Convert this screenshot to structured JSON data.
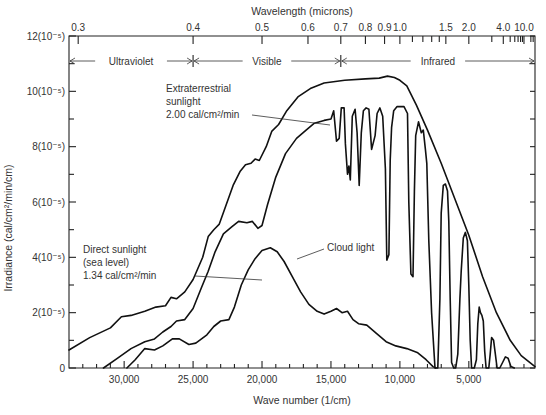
{
  "chart_data": {
    "type": "line",
    "title": "",
    "xlabel": "Wave number (1/cm)",
    "ylabel": "Irradiance (cal/cm²/min/cm)",
    "top_axis_label": "Wavelength (microns)",
    "xlim": [
      34000,
      200
    ],
    "x_reversed": true,
    "ylim": [
      0,
      12
    ],
    "y_unit_multiplier": "10^-5",
    "grid": false,
    "legend": "inline annotations",
    "x_ticks": [
      {
        "value": 30000,
        "label": "30,000"
      },
      {
        "value": 25000,
        "label": "25,000"
      },
      {
        "value": 20000,
        "label": "20,000"
      },
      {
        "value": 15000,
        "label": "15,000"
      },
      {
        "value": 10000,
        "label": "10,000"
      },
      {
        "value": 5000,
        "label": "5,000"
      }
    ],
    "y_ticks": [
      {
        "value": 0,
        "label": "0"
      },
      {
        "value": 2,
        "label": "2(10⁻⁵)"
      },
      {
        "value": 4,
        "label": "4(10⁻⁵)"
      },
      {
        "value": 6,
        "label": "6(10⁻⁵)"
      },
      {
        "value": 8,
        "label": "8(10⁻⁵)"
      },
      {
        "value": 10,
        "label": "10(10⁻⁵)"
      },
      {
        "value": 12,
        "label": "12(10⁻⁵)"
      }
    ],
    "top_ticks": [
      {
        "value": 0.3,
        "label": "0.3"
      },
      {
        "value": 0.4,
        "label": "0.4"
      },
      {
        "value": 0.5,
        "label": "0.5"
      },
      {
        "value": 0.6,
        "label": "0.6"
      },
      {
        "value": 0.7,
        "label": "0.7"
      },
      {
        "value": 0.8,
        "label": "0.8"
      },
      {
        "value": 0.9,
        "label": "0.9"
      },
      {
        "value": 1.0,
        "label": "1.0"
      },
      {
        "value": 1.5,
        "label": "1.5"
      },
      {
        "value": 2.0,
        "label": "2.0"
      },
      {
        "value": 4.0,
        "label": "4.0"
      },
      {
        "value": 10.0,
        "label": "10.0"
      }
    ],
    "top_minor_ticks": [
      1.1,
      1.2,
      1.3,
      1.4,
      3.0,
      5.0,
      6.0,
      7.0,
      8.0,
      9.0,
      20.0,
      30.0
    ],
    "regions": [
      {
        "label": "Ultraviolet",
        "from_um": 0.294,
        "to_um": 0.4
      },
      {
        "label": "Visible",
        "from_um": 0.4,
        "to_um": 0.7
      },
      {
        "label": "Infrared",
        "from_um": 0.7,
        "to_um": 50
      }
    ],
    "series": [
      {
        "name": "Extraterrestrial sunlight",
        "annotation": [
          "Extraterrestrial",
          "sunlight",
          "2.00 cal/cm²/min"
        ],
        "total": "2.00 cal/cm²/min",
        "points": [
          [
            34000,
            0.65
          ],
          [
            32500,
            1.1
          ],
          [
            31000,
            1.45
          ],
          [
            30200,
            1.85
          ],
          [
            29500,
            1.9
          ],
          [
            28500,
            2.05
          ],
          [
            27700,
            2.2
          ],
          [
            27000,
            2.25
          ],
          [
            26600,
            2.55
          ],
          [
            26200,
            2.5
          ],
          [
            25600,
            2.75
          ],
          [
            25000,
            3.2
          ],
          [
            24300,
            4.0
          ],
          [
            23900,
            4.75
          ],
          [
            23500,
            5.0
          ],
          [
            23100,
            5.2
          ],
          [
            22600,
            5.9
          ],
          [
            22100,
            6.6
          ],
          [
            21600,
            7.1
          ],
          [
            21200,
            7.35
          ],
          [
            20800,
            7.4
          ],
          [
            20500,
            7.55
          ],
          [
            20200,
            7.5
          ],
          [
            19700,
            8.0
          ],
          [
            19300,
            8.55
          ],
          [
            18800,
            8.8
          ],
          [
            18200,
            9.3
          ],
          [
            17400,
            9.8
          ],
          [
            16500,
            10.1
          ],
          [
            15500,
            10.3
          ],
          [
            14000,
            10.4
          ],
          [
            12500,
            10.45
          ],
          [
            11500,
            10.48
          ],
          [
            10900,
            10.55
          ],
          [
            10400,
            10.5
          ],
          [
            10000,
            10.4
          ],
          [
            9500,
            10.2
          ],
          [
            8800,
            9.5
          ],
          [
            8000,
            8.6
          ],
          [
            7000,
            7.4
          ],
          [
            6000,
            6.1
          ],
          [
            5000,
            4.8
          ],
          [
            4000,
            3.3
          ],
          [
            3000,
            2.0
          ],
          [
            2000,
            1.0
          ],
          [
            1200,
            0.45
          ],
          [
            200,
            0.05
          ]
        ]
      },
      {
        "name": "Direct sunlight (sea level)",
        "annotation": [
          "Direct sunlight",
          "(sea level)",
          "1.34 cal/cm²/min"
        ],
        "total": "1.34 cal/cm²/min",
        "points": [
          [
            31500,
            0
          ],
          [
            30500,
            0.35
          ],
          [
            29500,
            0.7
          ],
          [
            28500,
            0.95
          ],
          [
            27800,
            1.05
          ],
          [
            27200,
            1.3
          ],
          [
            26600,
            1.5
          ],
          [
            26200,
            1.7
          ],
          [
            25600,
            1.75
          ],
          [
            25000,
            2.15
          ],
          [
            24400,
            2.9
          ],
          [
            23900,
            3.5
          ],
          [
            23400,
            4.2
          ],
          [
            22800,
            4.85
          ],
          [
            22200,
            5.1
          ],
          [
            21700,
            5.3
          ],
          [
            21100,
            5.25
          ],
          [
            20700,
            5.3
          ],
          [
            20300,
            5.05
          ],
          [
            20000,
            5.15
          ],
          [
            19600,
            5.9
          ],
          [
            19000,
            6.9
          ],
          [
            18300,
            7.75
          ],
          [
            17500,
            8.3
          ],
          [
            16800,
            8.6
          ],
          [
            16200,
            8.85
          ],
          [
            15500,
            8.95
          ],
          [
            15000,
            9.0
          ],
          [
            14800,
            9.3
          ],
          [
            14600,
            8.2
          ],
          [
            14400,
            8.3
          ],
          [
            14250,
            9.4
          ],
          [
            14050,
            9.4
          ],
          [
            13950,
            8.1
          ],
          [
            13800,
            7.0
          ],
          [
            13700,
            7.3
          ],
          [
            13600,
            6.8
          ],
          [
            13450,
            9.1
          ],
          [
            13250,
            9.35
          ],
          [
            13100,
            8.5
          ],
          [
            12950,
            6.6
          ],
          [
            12800,
            8.5
          ],
          [
            12650,
            9.3
          ],
          [
            12450,
            9.4
          ],
          [
            12250,
            9.35
          ],
          [
            12050,
            7.9
          ],
          [
            11800,
            8.4
          ],
          [
            11650,
            9.2
          ],
          [
            11450,
            9.4
          ],
          [
            11250,
            9.1
          ],
          [
            11050,
            7.2
          ],
          [
            10950,
            3.9
          ],
          [
            10800,
            4.1
          ],
          [
            10700,
            7.5
          ],
          [
            10600,
            8.7
          ],
          [
            10450,
            9.3
          ],
          [
            10200,
            9.45
          ],
          [
            9700,
            9.45
          ],
          [
            9450,
            9.2
          ],
          [
            9350,
            6.0
          ],
          [
            9200,
            3.4
          ],
          [
            9050,
            3.3
          ],
          [
            8950,
            6.4
          ],
          [
            8850,
            8.4
          ],
          [
            8650,
            8.9
          ],
          [
            8450,
            8.5
          ],
          [
            8300,
            8.6
          ],
          [
            8150,
            7.9
          ],
          [
            8050,
            7.4
          ],
          [
            7900,
            4.6
          ],
          [
            7700,
            2.0
          ],
          [
            7450,
            0
          ],
          [
            7250,
            0
          ],
          [
            7100,
            2.5
          ],
          [
            7000,
            5.6
          ],
          [
            6850,
            6.6
          ],
          [
            6700,
            6.65
          ],
          [
            6550,
            6.4
          ],
          [
            6450,
            5.3
          ],
          [
            6350,
            2.5
          ],
          [
            6250,
            0.2
          ],
          [
            6100,
            0
          ],
          [
            5950,
            0
          ],
          [
            5800,
            0.5
          ],
          [
            5650,
            2.5
          ],
          [
            5550,
            3.5
          ],
          [
            5400,
            4.7
          ],
          [
            5250,
            4.9
          ],
          [
            5100,
            4.6
          ],
          [
            5000,
            3.0
          ],
          [
            4900,
            1.0
          ],
          [
            4800,
            0
          ],
          [
            4600,
            0
          ],
          [
            4450,
            0.3
          ],
          [
            4350,
            1.6
          ],
          [
            4250,
            2.2
          ],
          [
            4150,
            2.0
          ],
          [
            4050,
            1.9
          ],
          [
            3950,
            1.7
          ],
          [
            3850,
            0.6
          ],
          [
            3750,
            0
          ],
          [
            3550,
            0
          ],
          [
            3450,
            0.5
          ],
          [
            3350,
            1.1
          ],
          [
            3200,
            1.0
          ],
          [
            3100,
            0.6
          ],
          [
            2950,
            0
          ],
          [
            2750,
            0
          ],
          [
            2550,
            0.2
          ],
          [
            2350,
            0.4
          ],
          [
            2150,
            0.35
          ],
          [
            1950,
            0.05
          ],
          [
            1700,
            0
          ]
        ]
      },
      {
        "name": "Cloud light",
        "annotation": [
          "Cloud light"
        ],
        "points": [
          [
            29800,
            0
          ],
          [
            29200,
            0.3
          ],
          [
            28500,
            0.7
          ],
          [
            27800,
            0.65
          ],
          [
            27200,
            0.8
          ],
          [
            26500,
            1.05
          ],
          [
            26000,
            1.05
          ],
          [
            25300,
            0.85
          ],
          [
            24800,
            0.9
          ],
          [
            24000,
            1.2
          ],
          [
            23500,
            1.5
          ],
          [
            23000,
            1.7
          ],
          [
            22400,
            1.75
          ],
          [
            22000,
            2.2
          ],
          [
            21500,
            3.0
          ],
          [
            21000,
            3.55
          ],
          [
            20500,
            3.95
          ],
          [
            20000,
            4.25
          ],
          [
            19400,
            4.35
          ],
          [
            18900,
            4.2
          ],
          [
            18400,
            3.85
          ],
          [
            17800,
            3.3
          ],
          [
            17200,
            2.75
          ],
          [
            16600,
            2.3
          ],
          [
            16000,
            2.05
          ],
          [
            15500,
            1.95
          ],
          [
            15000,
            2.05
          ],
          [
            14600,
            2.15
          ],
          [
            14200,
            2.0
          ],
          [
            13800,
            2.05
          ],
          [
            13400,
            1.75
          ],
          [
            13000,
            1.6
          ],
          [
            12400,
            1.55
          ],
          [
            11700,
            1.25
          ],
          [
            11000,
            0.95
          ],
          [
            10300,
            0.8
          ],
          [
            9500,
            0.7
          ],
          [
            8700,
            0.55
          ],
          [
            8100,
            0.3
          ],
          [
            7600,
            0.05
          ],
          [
            7400,
            0
          ]
        ]
      }
    ]
  }
}
